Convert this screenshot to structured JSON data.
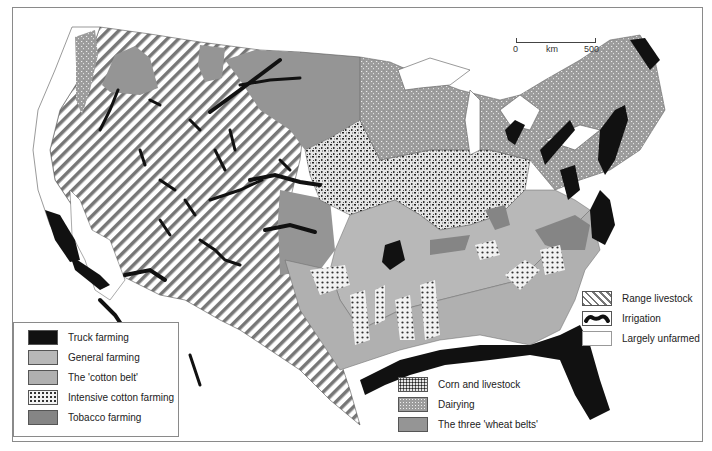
{
  "map": {
    "title": "Agricultural regions of the United States",
    "scale": {
      "min_label": "0",
      "unit_label": "km",
      "max_label": "500"
    },
    "colors": {
      "truck": "#111111",
      "general": "#b8b8b8",
      "cotton_belt": "#b0b0b0",
      "tobacco": "#858585",
      "wheat": "#959595",
      "dairy": "#a8a8a8",
      "corn": "#d8d8d8",
      "frame": "#8a8a8a"
    }
  },
  "legend_left": {
    "items": [
      {
        "label": "Truck farming",
        "swatch": "truck-farming"
      },
      {
        "label": "General farming",
        "swatch": "general-farming"
      },
      {
        "label": "The 'cotton belt'",
        "swatch": "cotton-belt"
      },
      {
        "label": "Intensive cotton farming",
        "swatch": "intensive-cotton"
      },
      {
        "label": "Tobacco farming",
        "swatch": "tobacco-farming"
      }
    ]
  },
  "legend_middle": {
    "items": [
      {
        "label": "Corn and livestock",
        "swatch": "corn-livestock"
      },
      {
        "label": "Dairying",
        "swatch": "dairying"
      },
      {
        "label": "The three 'wheat belts'",
        "swatch": "wheat-belts"
      }
    ]
  },
  "legend_right": {
    "items": [
      {
        "label": "Range livestock",
        "swatch": "range-livestock"
      },
      {
        "label": "Irrigation",
        "swatch": "irrigation"
      },
      {
        "label": "Largely unfarmed",
        "swatch": "unfarmed"
      }
    ]
  }
}
